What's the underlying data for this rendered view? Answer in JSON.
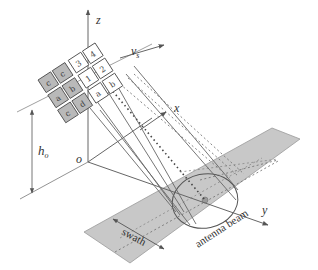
{
  "figure": {
    "type": "diagram",
    "labels": {
      "z_axis": "z",
      "x_axis": "x",
      "y_axis": "y",
      "origin": "o",
      "velocity": "v",
      "velocity_subscript": "s",
      "height": "h",
      "height_subscript": "o",
      "swath": "swath",
      "antenna_beam": "antenna beam"
    },
    "sensor_grid": {
      "rows": [
        {
          "tiles": [
            {
              "glyph": "c",
              "shaded": true
            },
            {
              "glyph": "c",
              "shaded": true
            },
            {
              "glyph": "3",
              "shaded": false
            },
            {
              "glyph": "4",
              "shaded": false
            }
          ]
        },
        {
          "tiles": [
            {
              "glyph": "a",
              "shaded": true
            },
            {
              "glyph": "b",
              "shaded": true
            },
            {
              "glyph": "1",
              "shaded": false
            },
            {
              "glyph": "2",
              "shaded": false
            }
          ]
        },
        {
          "tiles": [
            {
              "glyph": "c",
              "shaded": true
            },
            {
              "glyph": "d",
              "shaded": true
            },
            {
              "glyph": "a",
              "shaded": false
            },
            {
              "glyph": "b",
              "shaded": false
            }
          ]
        }
      ]
    },
    "colors": {
      "ground_strip": "#c8c8c8",
      "ground_strip_edge": "#8a8a8a",
      "tile_shaded": "#b9b9b9",
      "tile_open": "#ffffff",
      "line": "#555555",
      "axis": "#666666",
      "beam_center": "#9a9a9a"
    }
  }
}
